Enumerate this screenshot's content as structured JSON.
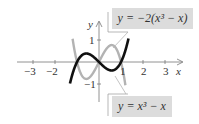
{
  "figure": {
    "type": "function-graph",
    "x_axis_label": "x",
    "y_axis_label": "y",
    "x_ticks": [
      "-3",
      "-2",
      "1",
      "2",
      "3"
    ],
    "y_ticks": [
      "1",
      "-1"
    ],
    "curves": [
      {
        "name": "y = x^3 - x",
        "label_html": "y = x<sup>3</sup> − x",
        "color": "#111111",
        "weight": "bold"
      },
      {
        "name": "y = -2(x^3 - x)",
        "label_html": "y = −2(x<sup>3</sup> − x)",
        "color": "#b3b3b3",
        "weight": "normal"
      }
    ],
    "colors": {
      "box_bg": "#dcdcdc",
      "axis": "#777777",
      "leader": "#999999"
    }
  },
  "labels": {
    "top_eq": "y = −2(x³ − x)",
    "bottom_eq": "y = x³ − x",
    "x": "x",
    "y": "y",
    "t_m3": "−3",
    "t_m2": "−2",
    "t_1": "1",
    "t_2": "2",
    "t_3": "3",
    "t_y1": "1",
    "t_ym1": "−1"
  }
}
